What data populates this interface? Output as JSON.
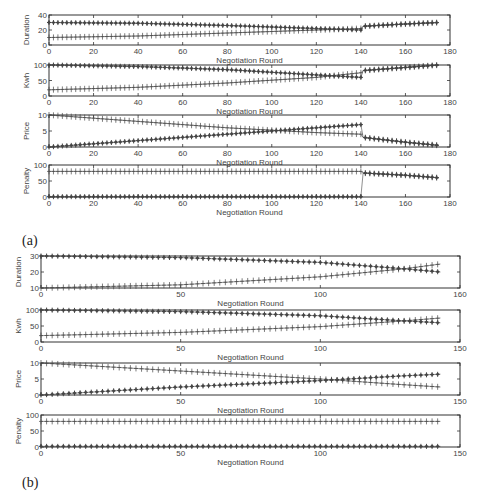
{
  "captions": {
    "a": "(a)",
    "b": "(b)"
  },
  "colors": {
    "axis": "#333333",
    "marker": "#444444",
    "background": "#ffffff"
  },
  "chart_data": [
    {
      "panel": "(a)",
      "type": "line",
      "xlabel": "Negotiation Round",
      "xlim": [
        0,
        180
      ],
      "xticks": [
        "0",
        "20",
        "40",
        "60",
        "80",
        "100",
        "120",
        "140",
        "160",
        "180"
      ],
      "subplots": [
        {
          "ylabel": "Duration",
          "ylim": [
            0,
            40
          ],
          "yticks": [
            "0",
            "20",
            "40"
          ],
          "series": [
            {
              "name": "star-marker",
              "marker": "*",
              "points": [
                [
                  0,
                  30
                ],
                [
                  40,
                  29
                ],
                [
                  80,
                  26
                ],
                [
                  120,
                  22
                ],
                [
                  140,
                  20
                ],
                [
                  141,
                  25
                ],
                [
                  160,
                  28
                ],
                [
                  175,
                  30
                ]
              ]
            },
            {
              "name": "plus-marker",
              "marker": "+",
              "points": [
                [
                  0,
                  10
                ],
                [
                  40,
                  12
                ],
                [
                  80,
                  16
                ],
                [
                  120,
                  20
                ],
                [
                  140,
                  22
                ],
                [
                  141,
                  25
                ],
                [
                  160,
                  28
                ],
                [
                  175,
                  30
                ]
              ]
            }
          ]
        },
        {
          "ylabel": "Kwh",
          "ylim": [
            0,
            100
          ],
          "yticks": [
            "0",
            "50",
            "100"
          ],
          "series": [
            {
              "name": "star-marker",
              "marker": "*",
              "points": [
                [
                  0,
                  100
                ],
                [
                  40,
                  95
                ],
                [
                  80,
                  85
                ],
                [
                  120,
                  68
                ],
                [
                  140,
                  60
                ],
                [
                  141,
                  82
                ],
                [
                  160,
                  92
                ],
                [
                  175,
                  100
                ]
              ]
            },
            {
              "name": "plus-marker",
              "marker": "+",
              "points": [
                [
                  0,
                  20
                ],
                [
                  40,
                  28
                ],
                [
                  80,
                  42
                ],
                [
                  120,
                  60
                ],
                [
                  140,
                  75
                ],
                [
                  141,
                  82
                ],
                [
                  160,
                  92
                ],
                [
                  175,
                  100
                ]
              ]
            }
          ]
        },
        {
          "ylabel": "Price",
          "ylim": [
            0,
            10
          ],
          "yticks": [
            "0",
            "5",
            "10"
          ],
          "series": [
            {
              "name": "plus-marker",
              "marker": "+",
              "points": [
                [
                  0,
                  10
                ],
                [
                  40,
                  8
                ],
                [
                  80,
                  6
                ],
                [
                  120,
                  4.5
                ],
                [
                  140,
                  4
                ],
                [
                  141,
                  3
                ],
                [
                  160,
                  1.5
                ],
                [
                  175,
                  0.5
                ]
              ]
            },
            {
              "name": "star-marker",
              "marker": "*",
              "points": [
                [
                  0,
                  0
                ],
                [
                  40,
                  2
                ],
                [
                  80,
                  4
                ],
                [
                  120,
                  6
                ],
                [
                  140,
                  7
                ],
                [
                  141,
                  3
                ],
                [
                  160,
                  1.5
                ],
                [
                  175,
                  0.5
                ]
              ]
            }
          ]
        },
        {
          "ylabel": "Penalty",
          "ylim": [
            0,
            100
          ],
          "yticks": [
            "0",
            "50",
            "100"
          ],
          "series": [
            {
              "name": "plus-marker",
              "marker": "+",
              "points": [
                [
                  0,
                  80
                ],
                [
                  140,
                  80
                ],
                [
                  141,
                  75
                ],
                [
                  160,
                  68
                ],
                [
                  175,
                  60
                ]
              ]
            },
            {
              "name": "star-marker",
              "marker": "*",
              "points": [
                [
                  0,
                  1
                ],
                [
                  140,
                  1
                ],
                [
                  141,
                  75
                ],
                [
                  160,
                  68
                ],
                [
                  175,
                  60
                ]
              ]
            }
          ]
        }
      ]
    },
    {
      "panel": "(b)",
      "type": "line",
      "xlabel": "Negotiation Round",
      "xlim": [
        0,
        150
      ],
      "subplots": [
        {
          "ylabel": "Duration",
          "ylim": [
            10,
            30
          ],
          "yticks": [
            "10",
            "20",
            "30"
          ],
          "xticks": [
            "0",
            "50",
            "100",
            "160"
          ],
          "series": [
            {
              "name": "star-marker",
              "marker": "*",
              "points": [
                [
                  0,
                  30
                ],
                [
                  50,
                  29
                ],
                [
                  100,
                  26
                ],
                [
                  130,
                  22
                ],
                [
                  143,
                  20
                ]
              ]
            },
            {
              "name": "plus-marker",
              "marker": "+",
              "points": [
                [
                  0,
                  10
                ],
                [
                  50,
                  12
                ],
                [
                  100,
                  17
                ],
                [
                  130,
                  22
                ],
                [
                  143,
                  25
                ]
              ]
            }
          ]
        },
        {
          "ylabel": "Kwh",
          "ylim": [
            0,
            100
          ],
          "yticks": [
            "0",
            "50",
            "100"
          ],
          "xticks": [
            "0",
            "50",
            "100",
            "150"
          ],
          "series": [
            {
              "name": "star-marker",
              "marker": "*",
              "points": [
                [
                  0,
                  100
                ],
                [
                  50,
                  95
                ],
                [
                  100,
                  82
                ],
                [
                  130,
                  66
                ],
                [
                  143,
                  60
                ]
              ]
            },
            {
              "name": "plus-marker",
              "marker": "+",
              "points": [
                [
                  0,
                  20
                ],
                [
                  50,
                  30
                ],
                [
                  100,
                  48
                ],
                [
                  130,
                  66
                ],
                [
                  143,
                  75
                ]
              ]
            }
          ]
        },
        {
          "ylabel": "Price",
          "ylim": [
            0,
            10
          ],
          "yticks": [
            "0",
            "5",
            "10"
          ],
          "xticks": [
            "0",
            "50",
            "100",
            "150"
          ],
          "series": [
            {
              "name": "plus-marker",
              "marker": "+",
              "points": [
                [
                  0,
                  10
                ],
                [
                  50,
                  7.5
                ],
                [
                  100,
                  5
                ],
                [
                  130,
                  3.2
                ],
                [
                  143,
                  2.5
                ]
              ]
            },
            {
              "name": "star-marker",
              "marker": "*",
              "points": [
                [
                  0,
                  0
                ],
                [
                  50,
                  2.5
                ],
                [
                  100,
                  4.5
                ],
                [
                  130,
                  6
                ],
                [
                  143,
                  6.5
                ]
              ]
            }
          ]
        },
        {
          "ylabel": "Penalty",
          "ylim": [
            0,
            100
          ],
          "yticks": [
            "0",
            "50",
            "100"
          ],
          "xticks": [
            "0",
            "50",
            "100",
            "150"
          ],
          "series": [
            {
              "name": "plus-marker",
              "marker": "+",
              "points": [
                [
                  0,
                  80
                ],
                [
                  143,
                  80
                ]
              ]
            },
            {
              "name": "star-marker",
              "marker": "*",
              "points": [
                [
                  0,
                  2
                ],
                [
                  143,
                  2
                ]
              ]
            }
          ]
        }
      ]
    }
  ]
}
